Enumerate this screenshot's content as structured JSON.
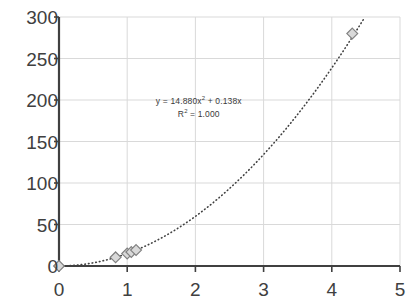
{
  "chart_data": {
    "type": "scatter",
    "title": "",
    "xlabel": "",
    "ylabel": "",
    "xlim": [
      0,
      5
    ],
    "ylim": [
      0,
      300
    ],
    "grid": true,
    "legend": false,
    "x_ticks": [
      "0",
      "1",
      "2",
      "3",
      "4",
      "5"
    ],
    "y_ticks": [
      "0",
      "50",
      "100",
      "150",
      "200",
      "250",
      "300"
    ],
    "x_tick_values": [
      0,
      1,
      2,
      3,
      4,
      5
    ],
    "y_tick_values": [
      0,
      50,
      100,
      150,
      200,
      250,
      300
    ],
    "series": [
      {
        "name": "data",
        "marker": "diamond",
        "marker_fill": "#d9d9d9",
        "marker_stroke": "#808080",
        "points": [
          {
            "x": 0.0,
            "y": 0
          },
          {
            "x": 0.83,
            "y": 10.4
          },
          {
            "x": 1.0,
            "y": 15.0
          },
          {
            "x": 1.06,
            "y": 16.9
          },
          {
            "x": 1.13,
            "y": 19.2
          },
          {
            "x": 4.3,
            "y": 280.0
          }
        ]
      }
    ],
    "trendline": {
      "type": "polynomial",
      "order": 2,
      "equation": "y = 14.880x² + 0.138x",
      "equation_prefix": "y = 14.880x",
      "equation_suffix": " + 0.138x",
      "r_squared_label": "R² = 1.000",
      "r_squared_prefix": "R",
      "r_squared_suffix": " = 1.000",
      "coefficients": {
        "a": 14.88,
        "b": 0.138,
        "c": 0
      },
      "r_squared": 1.0,
      "style": "dotted",
      "color": "#404040"
    },
    "annotations": [
      {
        "name": "trendline-equation",
        "lines": [
          "y = 14.880x² + 0.138x",
          "R² = 1.000"
        ],
        "x": 2.05,
        "y": 196
      }
    ],
    "colors": {
      "grid": "#d9d9d9",
      "axis": "#404040",
      "text": "#404040",
      "background": "#ffffff"
    }
  }
}
